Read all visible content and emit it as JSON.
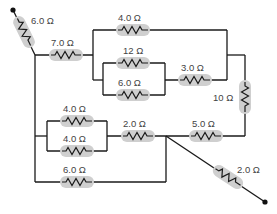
{
  "diagram": {
    "type": "circuit",
    "unit": "Ω",
    "resistors": [
      {
        "id": "r1",
        "label": "6.0 Ω",
        "orientation": "diagonal",
        "position": "top-left terminal lead"
      },
      {
        "id": "r2",
        "label": "7.0 Ω",
        "orientation": "horizontal",
        "position": "top-left series"
      },
      {
        "id": "r3",
        "label": "4.0 Ω",
        "orientation": "horizontal",
        "position": "top branch"
      },
      {
        "id": "r4",
        "label": "12 Ω",
        "orientation": "horizontal",
        "position": "inner parallel top"
      },
      {
        "id": "r5",
        "label": "6.0 Ω",
        "orientation": "horizontal",
        "position": "inner parallel bottom"
      },
      {
        "id": "r6",
        "label": "3.0 Ω",
        "orientation": "horizontal",
        "position": "series after inner parallel"
      },
      {
        "id": "r7",
        "label": "10 Ω",
        "orientation": "vertical",
        "position": "right side"
      },
      {
        "id": "r8",
        "label": "5.0 Ω",
        "orientation": "horizontal",
        "position": "right middle"
      },
      {
        "id": "r9",
        "label": "4.0 Ω",
        "orientation": "horizontal",
        "position": "lower-left parallel top"
      },
      {
        "id": "r10",
        "label": "4.0 Ω",
        "orientation": "horizontal",
        "position": "lower-left parallel bottom"
      },
      {
        "id": "r11",
        "label": "2.0 Ω",
        "orientation": "horizontal",
        "position": "middle series"
      },
      {
        "id": "r12",
        "label": "6.0 Ω",
        "orientation": "horizontal",
        "position": "bottom wire"
      },
      {
        "id": "r13",
        "label": "2.0 Ω",
        "orientation": "diagonal",
        "position": "bottom-right terminal lead"
      }
    ],
    "terminals": [
      "top-left",
      "bottom-right"
    ]
  }
}
